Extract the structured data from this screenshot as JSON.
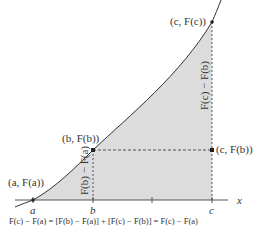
{
  "figure": {
    "axis_label": "x",
    "points": {
      "a": {
        "label": "(a, F(a))",
        "x_label": "a"
      },
      "b": {
        "label": "(b, F(b))",
        "x_label": "b"
      },
      "c": {
        "label": "(c, F(c))",
        "x_label": "c"
      },
      "cb": {
        "label": "(c, F(b))"
      }
    },
    "vertical_labels": {
      "left": "F(b) − F(a)",
      "right": "F(c) − F(b)"
    },
    "equation": "F(c) − F(a) = [F(b) − F(a)] + [F(c) − F(b)] = F(c) − F(a)",
    "colors": {
      "shade": "#dcdcdc",
      "curve": "#333333",
      "axis": "#555555",
      "dashed": "#555555"
    }
  }
}
